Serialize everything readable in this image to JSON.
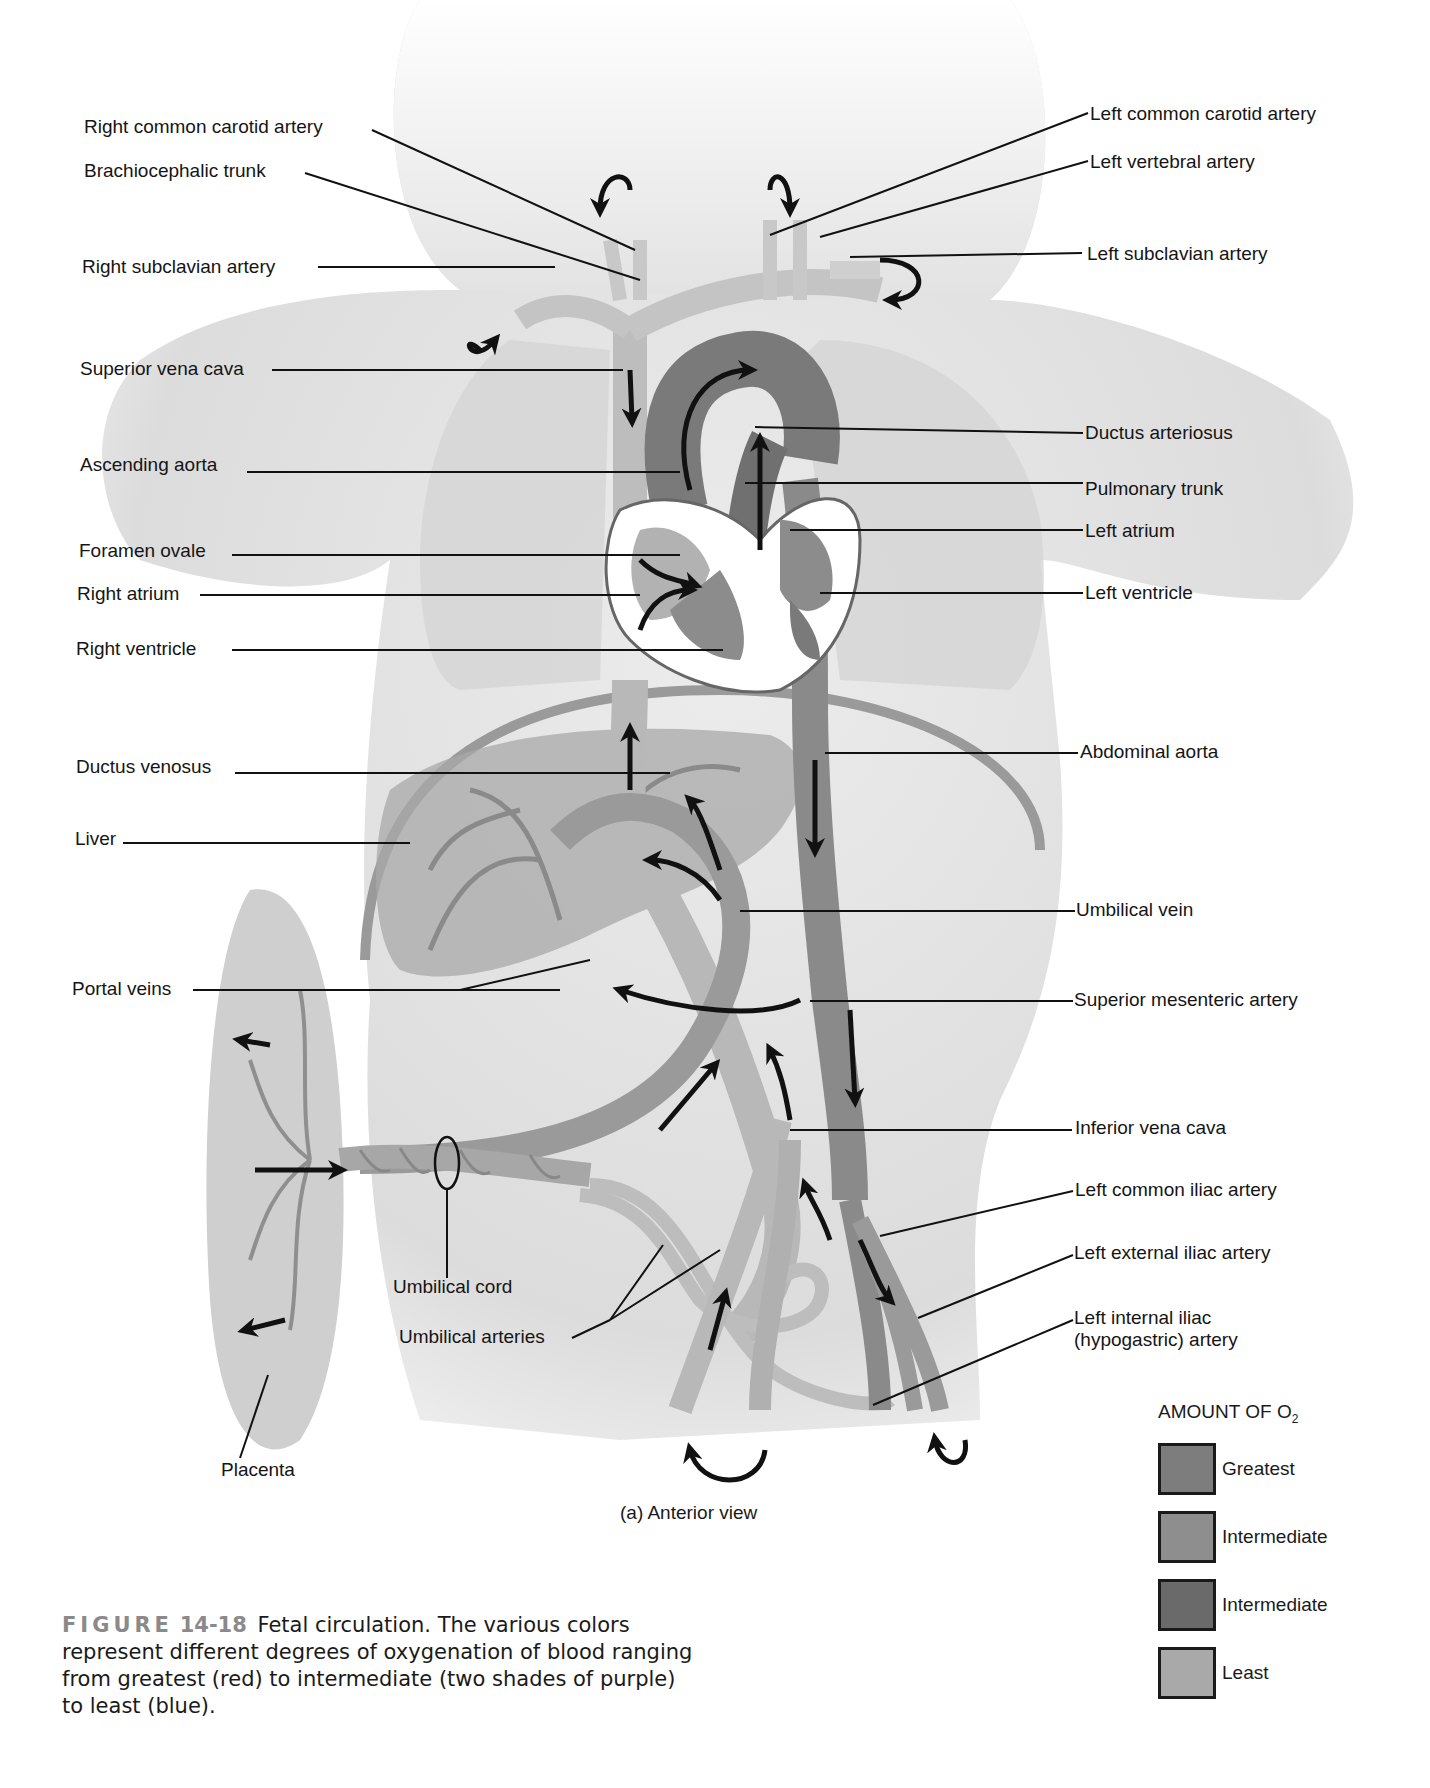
{
  "figure": {
    "view_label": "(a) Anterior view",
    "caption": {
      "figure_word": "FIGURE",
      "figure_number": "14-18",
      "text": "Fetal circulation. The various colors represent different degrees of oxygenation of blood ranging from greatest (red) to intermediate (two shades of purple) to least (blue)."
    }
  },
  "labels_left": [
    {
      "id": "right-common-carotid-artery",
      "text": "Right common carotid artery"
    },
    {
      "id": "brachiocephalic-trunk",
      "text": "Brachiocephalic trunk"
    },
    {
      "id": "right-subclavian-artery",
      "text": "Right subclavian artery"
    },
    {
      "id": "superior-vena-cava",
      "text": "Superior vena cava"
    },
    {
      "id": "ascending-aorta",
      "text": "Ascending aorta"
    },
    {
      "id": "foramen-ovale",
      "text": "Foramen ovale"
    },
    {
      "id": "right-atrium",
      "text": "Right atrium"
    },
    {
      "id": "right-ventricle",
      "text": "Right ventricle"
    },
    {
      "id": "ductus-venosus",
      "text": "Ductus venosus"
    },
    {
      "id": "liver",
      "text": "Liver"
    },
    {
      "id": "portal-veins",
      "text": "Portal veins"
    }
  ],
  "labels_right": [
    {
      "id": "left-common-carotid-artery",
      "text": "Left common carotid artery"
    },
    {
      "id": "left-vertebral-artery",
      "text": "Left vertebral artery"
    },
    {
      "id": "left-subclavian-artery",
      "text": "Left subclavian artery"
    },
    {
      "id": "ductus-arteriosus",
      "text": "Ductus arteriosus"
    },
    {
      "id": "pulmonary-trunk",
      "text": "Pulmonary trunk"
    },
    {
      "id": "left-atrium",
      "text": "Left  atrium"
    },
    {
      "id": "left-ventricle",
      "text": "Left  ventricle"
    },
    {
      "id": "abdominal-aorta",
      "text": "Abdominal  aorta"
    },
    {
      "id": "umbilical-vein",
      "text": "Umbilical vein"
    },
    {
      "id": "superior-mesenteric-artery",
      "text": "Superior mesenteric artery"
    },
    {
      "id": "inferior-vena-cava",
      "text": "Inferior vena cava"
    },
    {
      "id": "left-common-iliac-artery",
      "text": "Left common iliac artery"
    },
    {
      "id": "left-external-iliac-artery",
      "text": "Left external iliac artery"
    },
    {
      "id": "left-internal-iliac-artery",
      "text": "Left internal iliac (hypogastric) artery"
    }
  ],
  "labels_bottom": [
    {
      "id": "umbilical-cord",
      "text": "Umbilical cord"
    },
    {
      "id": "umbilical-arteries",
      "text": "Umbilical arteries"
    },
    {
      "id": "placenta",
      "text": "Placenta"
    }
  ],
  "legend": {
    "title": "AMOUNT OF O",
    "title_subscript": "2",
    "items": [
      {
        "label": "Greatest",
        "color": "#7d7d7d"
      },
      {
        "label": "Intermediate",
        "color": "#8e8e8e"
      },
      {
        "label": "Intermediate",
        "color": "#6a6a6a"
      },
      {
        "label": "Least",
        "color": "#a9a9a9"
      }
    ]
  },
  "colors": {
    "body_silhouette": "#e6e6e6",
    "lung": "#d9d9d9",
    "oxygenated": "#7d7d7d",
    "mixed_light": "#9a9a9a",
    "mixed_dark": "#6e6e6e",
    "deoxygenated": "#b4b4b4",
    "arrow": "#111111"
  }
}
